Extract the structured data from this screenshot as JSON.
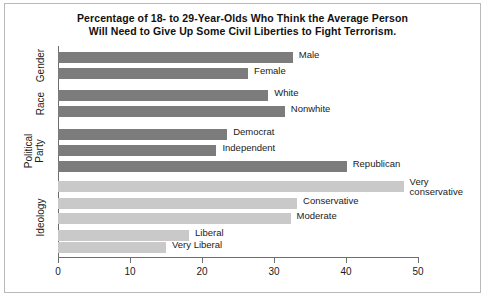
{
  "chart_data": {
    "type": "bar",
    "orientation": "horizontal",
    "title": "Percentage of 18- to 29-Year-Olds Who Think the Average Person Will Need to Give Up Some Civil Liberties to Fight Terrorism.",
    "title_lines": [
      "Percentage of 18- to 29-Year-Olds Who Think the Average Person",
      "Will Need to Give Up Some Civil Liberties to Fight Terrorism."
    ],
    "xlabel": "",
    "ylabel": "",
    "xlim": [
      0,
      50
    ],
    "xticks": [
      0,
      10,
      20,
      30,
      40,
      50
    ],
    "xtick_labels": [
      "0",
      "10",
      "20",
      "30",
      "40",
      "50"
    ],
    "grid": false,
    "legend": "none",
    "colors": {
      "dark_bar": "#7c7c7c",
      "light_bar": "#c9c9c9",
      "axis": "#6e6e6e",
      "text": "#1a1a1a",
      "frame": "#b9b9b9",
      "background": "#ffffff"
    },
    "groups": [
      {
        "name": "Gender",
        "shade": "dark",
        "bars": [
          {
            "label": "Male",
            "value": 32.6
          },
          {
            "label": "Female",
            "value": 26.4
          }
        ]
      },
      {
        "name": "Race",
        "shade": "dark",
        "bars": [
          {
            "label": "White",
            "value": 29.2
          },
          {
            "label": "Nonwhite",
            "value": 31.5
          }
        ]
      },
      {
        "name": "Political Party",
        "name_lines": [
          "Political",
          "Party"
        ],
        "shade": "dark",
        "bars": [
          {
            "label": "Democrat",
            "value": 23.5
          },
          {
            "label": "Independent",
            "value": 22.0
          },
          {
            "label": "Republican",
            "value": 40.1
          }
        ]
      },
      {
        "name": "Ideology",
        "shade": "light",
        "bars": [
          {
            "label": "Very conservative",
            "label_lines": [
              "Very",
              "conservative"
            ],
            "value": 48.0
          },
          {
            "label": "Conservative",
            "value": 33.2
          },
          {
            "label": "Moderate",
            "value": 32.3
          },
          {
            "label": "Liberal",
            "value": 18.2
          },
          {
            "label": "Very Liberal",
            "value": 15.0
          }
        ]
      }
    ]
  },
  "categories_flat": [
    "Male",
    "Female",
    "White",
    "Nonwhite",
    "Democrat",
    "Independent",
    "Republican",
    "Very conservative",
    "Conservative",
    "Moderate",
    "Liberal",
    "Very Liberal"
  ],
  "values_flat": [
    32.6,
    26.4,
    29.2,
    31.5,
    23.5,
    22.0,
    40.1,
    48.0,
    33.2,
    32.3,
    18.2,
    15.0
  ],
  "group_labels": [
    "Gender",
    "Race",
    "Political Party",
    "Ideology"
  ]
}
